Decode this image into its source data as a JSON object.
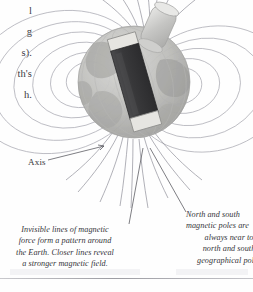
{
  "page": {
    "background_color": "#ffffff"
  },
  "cut_column": {
    "name": "clipped-body-text-column",
    "lines": [
      "l",
      "g",
      "s).",
      "th's",
      "h."
    ]
  },
  "diagram": {
    "name": "earth-magnetic-field-illustration",
    "globe": {
      "label": "earth-globe",
      "fill_light": "#c9c9c7",
      "fill_mid": "#aeaeab",
      "fill_dark": "#8e8e8c"
    },
    "magnet": {
      "label": "bar-magnet",
      "body_color": "#3b3b3d",
      "tip_color": "#e4e3df"
    },
    "axis_rod": {
      "label": "rotation-axis-rod",
      "color": "#d4d4d2"
    },
    "field_lines": {
      "label": "magnetic-field-lines",
      "color": "#9a9aa4"
    }
  },
  "labels": {
    "axis": "Axis"
  },
  "captions": {
    "left": {
      "name": "field-lines-caption",
      "lines": [
        "Invisible lines of magnetic",
        "force form a pattern around",
        "the Earth. Closer lines reveal",
        "a stronger magnetic field."
      ]
    },
    "right": {
      "name": "magnetic-poles-caption",
      "lines": [
        "North and south",
        "magnetic poles are",
        "always near to",
        "north and south",
        "geographical poles"
      ]
    }
  }
}
